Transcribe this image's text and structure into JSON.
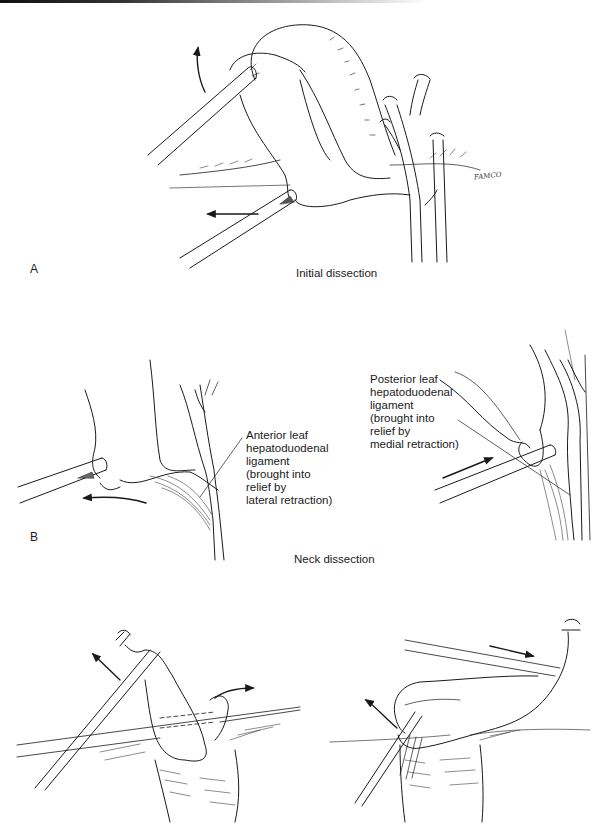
{
  "figure": {
    "panel_a": {
      "letter": "A",
      "caption": "Initial dissection",
      "signature": "FAMCO"
    },
    "panel_b": {
      "letter": "B",
      "caption": "Neck dissection",
      "left_label": "Anterior leaf\nhepatoduodenal\nligament\n(brought into\nrelief by\nlateral retraction)",
      "right_label": "Posterior leaf\nhepatoduodenal\nligament\n(brought into\nrelief by\nmedial retraction)"
    },
    "panel_c": {
      "letter": "",
      "caption": ""
    }
  },
  "icons": {
    "arrow": "retraction-arrow",
    "instrument": "grasper-instrument"
  },
  "colors": {
    "ink": "#1a1a1a",
    "background": "#ffffff"
  }
}
